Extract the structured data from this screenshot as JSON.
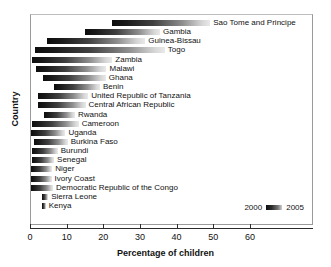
{
  "chart_data": {
    "type": "bar",
    "orientation": "horizontal",
    "title": "",
    "xlabel": "Percentage of children",
    "ylabel": "Country",
    "xlim": [
      0,
      70
    ],
    "xticks": [
      0,
      10,
      20,
      30,
      40,
      50,
      60
    ],
    "xticklabels": [
      "0",
      "10",
      "20",
      "30",
      "40",
      "50",
      "60"
    ],
    "grid": false,
    "legend": {
      "position": "bottom-right",
      "start_label": "2000",
      "end_label": "2005",
      "note": "bar spans value in 2000 (dark end) to value in 2005 (light end)"
    },
    "series": [
      {
        "name": "2000",
        "values": [
          22.2,
          14.7,
          4.4,
          1.1,
          0.4,
          1.3,
          3.4,
          6.4,
          2.0,
          1.8,
          3.6,
          0.3,
          0.0,
          0.9,
          0.2,
          0.3,
          0.0,
          0.0,
          0.0,
          3.1,
          2.9
        ]
      },
      {
        "name": "2005",
        "values": [
          48.9,
          35.2,
          31.2,
          36.5,
          22.2,
          20.6,
          20.4,
          18.8,
          15.6,
          14.9,
          12.0,
          13.0,
          9.4,
          10.0,
          7.3,
          6.3,
          5.8,
          5.6,
          6.0,
          4.7,
          4.0
        ]
      }
    ],
    "categories": [
      "Sao Tome and Principe",
      "Gambia",
      "Guinea-Bissau",
      "Togo",
      "Zambia",
      "Malawi",
      "Ghana",
      "Benin",
      "United Republic of Tanzania",
      "Central African Republic",
      "Rwanda",
      "Cameroon",
      "Uganda",
      "Burkina Faso",
      "Burundi",
      "Senegal",
      "Niger",
      "Ivory Coast",
      "Democratic Republic of the Congo",
      "Sierra Leone",
      "Kenya"
    ]
  },
  "colors": {
    "bar_dark": "#0d0d0d",
    "bar_light": "#e9e9e9",
    "axis": "#2b2b2b",
    "frame": "#9a9a9a",
    "text": "#111111",
    "background": "#ffffff"
  }
}
